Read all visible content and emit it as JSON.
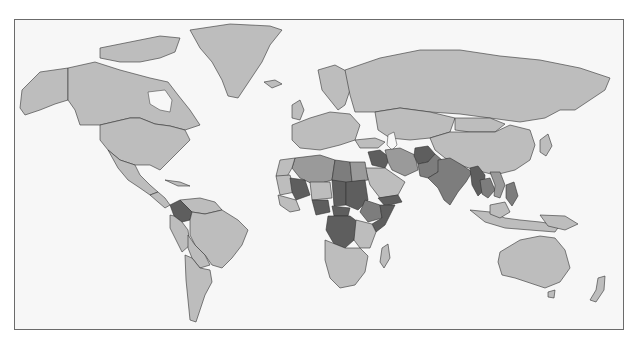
{
  "map": {
    "type": "world-choropleth",
    "projection": "Miller cylindrical",
    "colors": {
      "background": "#f7f7f7",
      "frame": "#6b6b6b",
      "base_land": "#bdbdbd",
      "class_low": "#9a9a9a",
      "class_mid": "#7d7d7d",
      "class_high": "#5e5e5e"
    },
    "highlighted_regions": {
      "class_high": [
        "Colombia",
        "Mali",
        "Nigeria",
        "Sudan",
        "Chad",
        "Central African Republic",
        "DR Congo",
        "Somalia",
        "Yemen",
        "Iraq",
        "Afghanistan",
        "Myanmar"
      ],
      "class_mid": [
        "Libya",
        "Pakistan",
        "India",
        "Thailand",
        "Philippines",
        "Ethiopia"
      ],
      "class_low": [
        "Egypt",
        "Iran",
        "Saudi Arabia",
        "Algeria",
        "Cambodia",
        "Laos"
      ]
    }
  }
}
